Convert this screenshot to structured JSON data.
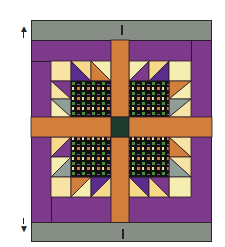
{
  "figure": {
    "type": "quilt-layout-diagram",
    "top_band": {
      "label": "",
      "marker": "|"
    },
    "bottom_band": {
      "label": "",
      "marker": "|"
    },
    "top_arrow": "up-arrow",
    "bottom_arrow": "down-arrow"
  },
  "colors": {
    "gray_band": "#8f968e",
    "purple": "#7d3a8a",
    "dark_purple": "#5a2d8c",
    "orange": "#d27f3c",
    "cream": "#f7e3a3",
    "pale_yellow": "#f6eeb0",
    "gray_green": "#8f9f98",
    "black": "#111111",
    "center_green": "#1f3a2e",
    "check_green": "#4b8e3a",
    "check_purple": "#8a4ea0",
    "check_orange": "#d07a3a",
    "check_cream": "#f1e0a0"
  }
}
